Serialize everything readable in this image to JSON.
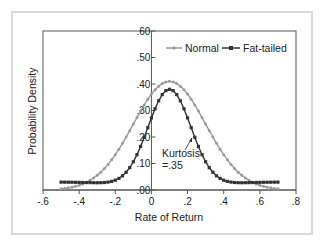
{
  "chart_data": {
    "type": "line",
    "title": "",
    "xlabel": "Rate of Return",
    "ylabel": "Probability Density",
    "xlim": [
      -0.6,
      0.8
    ],
    "ylim": [
      0,
      0.6
    ],
    "x_ticks": [
      "-.6",
      "-.4",
      "-.2",
      "0",
      ".2",
      ".4",
      ".6",
      ".8"
    ],
    "y_ticks": [
      ".00",
      ".10",
      ".20",
      ".30",
      ".40",
      ".50",
      ".60"
    ],
    "grid": false,
    "legend_position": "top-right inside",
    "series": [
      {
        "name": "Normal",
        "color": "#9a9a9a",
        "marker": "dot",
        "distribution": "normal",
        "mean": 0.1,
        "peak": 0.41,
        "x_range": [
          -0.5,
          0.7
        ],
        "endpoints": {
          "x=-0.5": 0.005,
          "x=0.7": 0.005
        }
      },
      {
        "name": "Fat-tailed",
        "color": "#333333",
        "marker": "square",
        "distribution": "fat-tailed",
        "mean": 0.1,
        "peak": 0.41,
        "x_range": [
          -0.5,
          0.7
        ],
        "endpoints": {
          "x=-0.5": 0.03,
          "x=0.7": 0.03
        }
      }
    ],
    "annotations": [
      {
        "text": "Kurtosis\n=.35",
        "line1": "Kurtosis",
        "line2": "=.35",
        "arrow_to": [
          0.2,
          0.2
        ]
      }
    ]
  },
  "legend": {
    "normal": "Normal",
    "fat_tailed": "Fat-tailed"
  },
  "annotation": {
    "line1": "Kurtosis",
    "line2": "=.35"
  },
  "axes": {
    "xlabel": "Rate of Return",
    "ylabel": "Probability Density"
  }
}
